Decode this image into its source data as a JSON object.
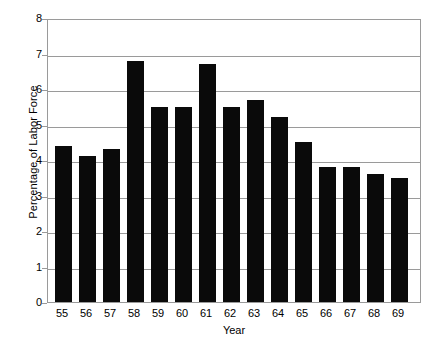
{
  "chart_data": {
    "type": "bar",
    "title": "",
    "xlabel": "Year",
    "ylabel": "Percentage of Labor Force",
    "categories": [
      "55",
      "56",
      "57",
      "58",
      "59",
      "60",
      "61",
      "62",
      "63",
      "64",
      "65",
      "66",
      "67",
      "68",
      "69"
    ],
    "values": [
      4.4,
      4.1,
      4.3,
      6.8,
      5.5,
      5.5,
      6.7,
      5.5,
      5.7,
      5.2,
      4.5,
      3.8,
      3.8,
      3.6,
      3.5
    ],
    "ylim": [
      0,
      8
    ],
    "ytick_labels": [
      "0",
      "1",
      "2",
      "3",
      "4",
      "5",
      "6",
      "7",
      "8"
    ],
    "ytick_values": [
      0,
      1,
      2,
      3,
      4,
      5,
      6,
      7,
      8
    ],
    "grid": "horizontal",
    "legend": "none",
    "bar_color": "#0a0a0a",
    "gridline_color": "#9a9a9a",
    "axis_color": "#9a9a9a",
    "background_color": "#ffffff"
  }
}
